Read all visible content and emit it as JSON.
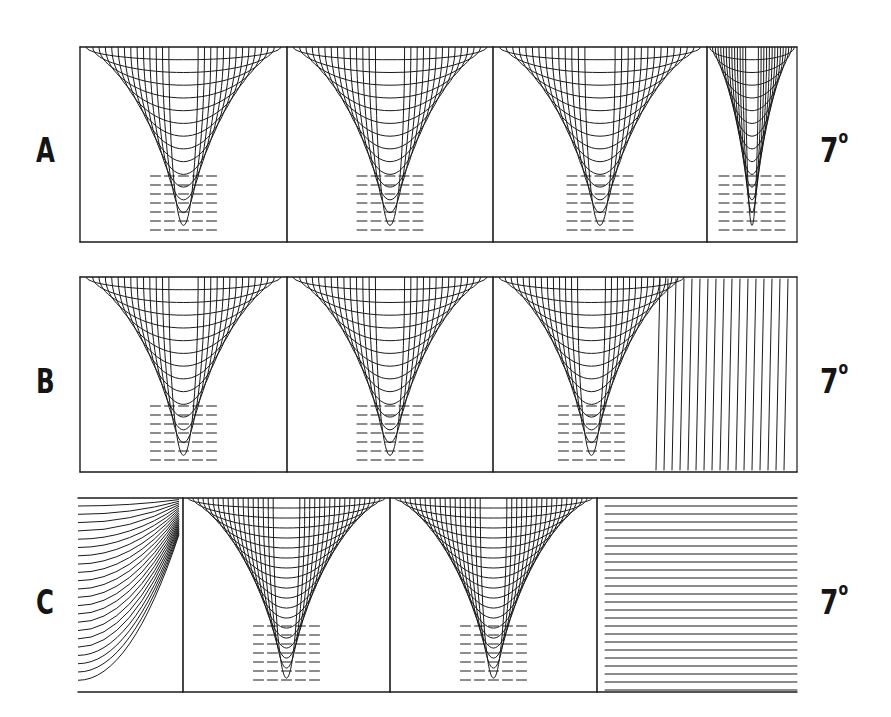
{
  "figure": {
    "panels": [
      {
        "id": "A",
        "label": "A",
        "angle": "7",
        "angle_unit": "°",
        "box": {
          "x0": 80,
          "x1": 797,
          "y0": 47,
          "y1": 242
        },
        "walls": [
          80,
          287,
          493,
          707
        ],
        "side_borders": true,
        "pattern": "arches",
        "label_pos": {
          "x": 36,
          "y": 130
        },
        "angle_pos": {
          "x": 820,
          "y": 130
        }
      },
      {
        "id": "B",
        "label": "B",
        "angle": "7",
        "angle_unit": "°",
        "box": {
          "x0": 80,
          "x1": 797,
          "y0": 277,
          "y1": 472
        },
        "walls": [
          80,
          287,
          493
        ],
        "side_borders": true,
        "pattern": "arches-then-vertical",
        "vertical_region_start": 600,
        "label_pos": {
          "x": 36,
          "y": 361
        },
        "angle_pos": {
          "x": 820,
          "y": 361
        }
      },
      {
        "id": "C",
        "label": "C",
        "angle": "7",
        "angle_unit": "°",
        "box": {
          "x0": 78,
          "x1": 797,
          "y0": 498,
          "y1": 692
        },
        "walls": [
          183,
          390,
          597
        ],
        "side_borders": false,
        "pattern": "arches-horizontal-edges",
        "label_pos": {
          "x": 36,
          "y": 582
        },
        "angle_pos": {
          "x": 820,
          "y": 582
        }
      }
    ],
    "line_color": "#1a1a1a"
  }
}
